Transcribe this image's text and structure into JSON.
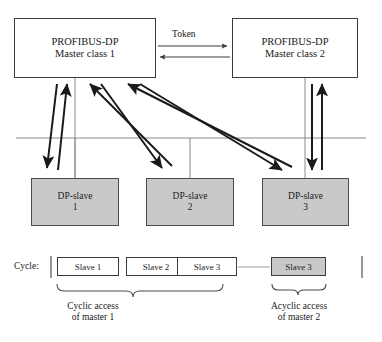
{
  "diagram": {
    "colors": {
      "slave_fill": "#c9c9c9",
      "box_stroke": "#3a3a3a",
      "arrow": "#1a1a1a",
      "bus_line": "#808080",
      "text": "#1a1a1a"
    },
    "masters": [
      {
        "id": "master-1",
        "line1": "PROFIBUS-DP",
        "line2": "Master class 1"
      },
      {
        "id": "master-2",
        "line1": "PROFIBUS-DP",
        "line2": "Master class 2"
      }
    ],
    "token": {
      "label": "Token"
    },
    "slaves": [
      {
        "id": "dp-slave-1",
        "line1": "DP-slave",
        "line2": "1"
      },
      {
        "id": "dp-slave-2",
        "line1": "DP-slave",
        "line2": "2"
      },
      {
        "id": "dp-slave-3",
        "line1": "DP-slave",
        "line2": "3"
      }
    ],
    "cycle": {
      "label": "Cycle:",
      "slots": [
        {
          "id": "cycle-slot-slave-1",
          "label": "Slave 1",
          "highlighted": false
        },
        {
          "id": "cycle-slot-slave-2",
          "label": "Slave 2",
          "highlighted": false
        },
        {
          "id": "cycle-slot-slave-3",
          "label": "Slave 3",
          "highlighted": false
        },
        {
          "id": "cycle-slot-slave-3-acyclic",
          "label": "Slave 3",
          "highlighted": true
        }
      ],
      "captions": [
        {
          "id": "cyclic-access-caption",
          "line1": "Cyclic access",
          "line2": "of master 1"
        },
        {
          "id": "acyclic-access-caption",
          "line1": "Acyclic access",
          "line2": "of master 2"
        }
      ]
    }
  }
}
